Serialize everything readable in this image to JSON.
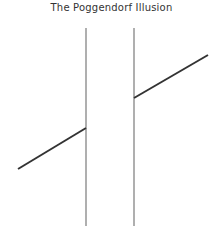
{
  "title": "The Poggendorf Illusion",
  "figure": {
    "vertical_lines": [
      {
        "x": 86,
        "y1": 28,
        "y2": 226
      },
      {
        "x": 134,
        "y1": 28,
        "y2": 226
      }
    ],
    "diagonal_segments": [
      {
        "x1": 18,
        "y1": 169,
        "x2": 86,
        "y2": 128
      },
      {
        "x1": 134,
        "y1": 98,
        "x2": 208,
        "y2": 55
      }
    ],
    "colors": {
      "vertical": "#7a7a7a",
      "diagonal": "#333333",
      "background": "#ffffff"
    }
  }
}
